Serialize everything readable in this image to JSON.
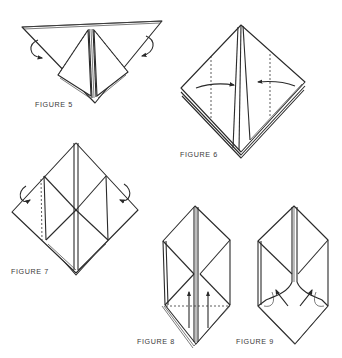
{
  "diagram": {
    "figures": [
      {
        "id": 5,
        "label": "FIGURE 5",
        "instruction_marks": [
          "fold-behind arrows on both sides",
          "dashed fold lines on inner edges"
        ]
      },
      {
        "id": 6,
        "label": "FIGURE 6",
        "instruction_marks": [
          "arrows pointing to center",
          "vertical dashed fold lines"
        ]
      },
      {
        "id": 7,
        "label": "FIGURE 7",
        "instruction_marks": [
          "fold-behind arrows on both sides",
          "vertical dashed fold line on left"
        ]
      },
      {
        "id": 8,
        "label": "FIGURE 8",
        "instruction_marks": [
          "two upward arrows",
          "horizontal dashed fold line"
        ]
      },
      {
        "id": 9,
        "label": "FIGURE 9",
        "instruction_marks": [
          "curved arrows folding inward",
          "inside-reverse folds"
        ]
      }
    ]
  },
  "colors": {
    "line": "#2a2a2a",
    "background": "#ffffff",
    "label": "#3a3a3a"
  }
}
